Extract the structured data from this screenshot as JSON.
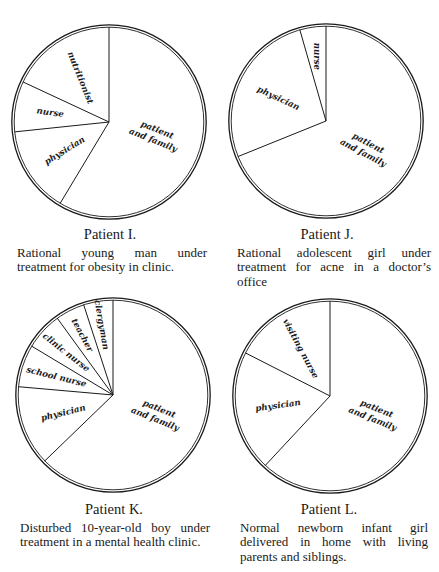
{
  "chart_data": [
    {
      "type": "pie",
      "title": "Patient I.",
      "description": "Rational young man under treatment for obesity in clinic.",
      "start_angle_deg": 90,
      "direction": "counterclockwise",
      "slices": [
        {
          "label": "nutritionist",
          "degrees": 65,
          "percent": 18
        },
        {
          "label": "nurse",
          "degrees": 31,
          "percent": 8.6
        },
        {
          "label": "physician",
          "degrees": 53,
          "percent": 14.7
        },
        {
          "label": "patient and family",
          "degrees": 211,
          "percent": 58.6
        }
      ]
    },
    {
      "type": "pie",
      "title": "Patient J.",
      "description": "Rational adolescent girl under treatment for acne in a doctor’s office",
      "start_angle_deg": 90,
      "direction": "counterclockwise",
      "slices": [
        {
          "label": "nurse",
          "degrees": 16,
          "percent": 4.4
        },
        {
          "label": "physician",
          "degrees": 96,
          "percent": 26.7
        },
        {
          "label": "patient and family",
          "degrees": 248,
          "percent": 68.9
        }
      ]
    },
    {
      "type": "pie",
      "title": "Patient K.",
      "description": "Disturbed 10-year-old boy under treatment in a mental health clinic.",
      "start_angle_deg": 90,
      "direction": "counterclockwise",
      "slices": [
        {
          "label": "clergyman",
          "degrees": 18,
          "percent": 5
        },
        {
          "label": "teacher",
          "degrees": 18,
          "percent": 5
        },
        {
          "label": "clinic nurse",
          "degrees": 23,
          "percent": 6.4
        },
        {
          "label": "school nurse",
          "degrees": 26,
          "percent": 7.2
        },
        {
          "label": "physician",
          "degrees": 49,
          "percent": 13.6
        },
        {
          "label": "patient and family",
          "degrees": 226,
          "percent": 62.8
        }
      ]
    },
    {
      "type": "pie",
      "title": "Patient L.",
      "description": "Normal newborn infant girl delivered in home with living parents and siblings.",
      "start_angle_deg": 90,
      "direction": "counterclockwise",
      "slices": [
        {
          "label": "visiting nurse",
          "degrees": 63,
          "percent": 17.5
        },
        {
          "label": "physician",
          "degrees": 74,
          "percent": 20.6
        },
        {
          "label": "patient and family",
          "degrees": 223,
          "percent": 61.9
        }
      ]
    }
  ],
  "colors": {
    "ink": "#1a1a1a",
    "paper": "#ffffff"
  }
}
